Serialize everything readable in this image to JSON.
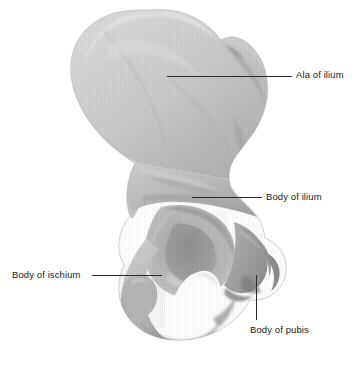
{
  "figure": {
    "background_color": "#ffffff",
    "width": 360,
    "height": 373,
    "bone_fill_light": "#d2d2d2",
    "bone_fill_mid": "#bcbcbc",
    "bone_fill_dark": "#9d9d9d",
    "bone_fill_darker": "#868686",
    "foramen_color": "#ffffff",
    "leader_color": "#2a2a2a",
    "text_color": "#1b1b1b"
  },
  "labels": [
    {
      "id": "ala-of-ilium",
      "text": "Ala of ilium",
      "text_left": 296,
      "text_top": 69,
      "leader": {
        "orientation": "horizontal",
        "left": 167,
        "top": 76,
        "length": 125
      }
    },
    {
      "id": "body-of-ilium",
      "text": "Body of ilium",
      "text_left": 266,
      "text_top": 191,
      "leader": {
        "orientation": "horizontal",
        "left": 192,
        "top": 197,
        "length": 70
      }
    },
    {
      "id": "body-of-ischium",
      "text": "Body of ischium",
      "text_left": 12,
      "text_top": 269,
      "leader": {
        "orientation": "horizontal",
        "left": 92,
        "top": 275,
        "length": 70
      }
    },
    {
      "id": "body-of-pubis",
      "text": "Body of pubis",
      "text_left": 250,
      "text_top": 324,
      "leader": {
        "orientation": "vertical",
        "left": 256,
        "top": 275,
        "length": 45
      }
    }
  ],
  "anatomy_regions": [
    {
      "name": "ala-of-ilium",
      "description": "Large fan-shaped superior blade of the ilium"
    },
    {
      "name": "iliac-crest",
      "description": "Superior convex border of the ala"
    },
    {
      "name": "greater-sciatic-notch",
      "description": "Deep concavity on posterior-inferior ilium"
    },
    {
      "name": "body-of-ilium",
      "description": "Thick region above the acetabulum"
    },
    {
      "name": "acetabulum",
      "description": "Cup-shaped socket for the femoral head"
    },
    {
      "name": "lunate-surface",
      "description": "Horseshoe-shaped articular rim of the acetabulum"
    },
    {
      "name": "acetabular-fossa",
      "description": "Non-articular depression in the acetabulum floor"
    },
    {
      "name": "obturator-foramen",
      "description": "Large oval opening inferior to the acetabulum"
    },
    {
      "name": "body-of-ischium",
      "description": "Posterior-inferior body forming the ischial region"
    },
    {
      "name": "ischial-tuberosity",
      "description": "Roughened inferior prominence of the ischium"
    },
    {
      "name": "body-of-pubis",
      "description": "Anterior region joining the superior pubic ramus"
    },
    {
      "name": "superior-pubic-ramus",
      "description": "Bar of bone projecting anteriorly from the pubis"
    }
  ]
}
